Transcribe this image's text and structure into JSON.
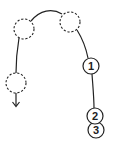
{
  "diagram": {
    "stroke_color": "#222222",
    "background": "#ffffff",
    "numbered_nodes": [
      {
        "label": "1",
        "cx": 91,
        "cy": 66,
        "r": 8
      },
      {
        "label": "2",
        "cx": 95,
        "cy": 116,
        "r": 8
      },
      {
        "label": "3",
        "cx": 96,
        "cy": 130,
        "r": 8
      }
    ],
    "dashed_nodes": [
      {
        "name": "dashed-top-left",
        "cx": 24,
        "cy": 29,
        "r": 10
      },
      {
        "name": "dashed-top-right",
        "cx": 70,
        "cy": 22,
        "r": 10
      },
      {
        "name": "dashed-lower-left",
        "cx": 16,
        "cy": 83,
        "r": 10
      }
    ],
    "arrow": {
      "direction": "down",
      "x": 16,
      "y_start": 93,
      "y_end": 106
    }
  }
}
